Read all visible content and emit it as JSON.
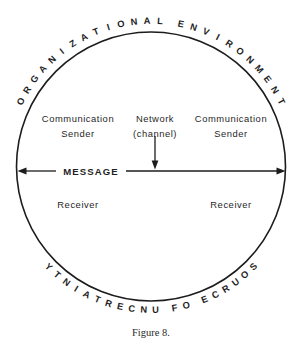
{
  "figure": {
    "caption": "Figure 8.",
    "arc_top": "ORGANIZATIONAL ENVIRONMENT",
    "arc_bottom": "SOURCE OF UNCERTAINTY",
    "left_sender_line1": "Communication",
    "left_sender_line2": "Sender",
    "center_line1": "Network",
    "center_line2": "(channel)",
    "right_sender_line1": "Communication",
    "right_sender_line2": "Sender",
    "message_label": "MESSAGE",
    "left_receiver": "Receiver",
    "right_receiver": "Receiver",
    "colors": {
      "ink": "#1c1c1c",
      "background": "#ffffff"
    }
  },
  "chart_data": {
    "type": "diagram",
    "title": "Figure 8.",
    "shape": "circle",
    "circle": {
      "cx": 151,
      "cy": 166,
      "r": 134
    },
    "arc_labels": [
      {
        "name": "arc-top",
        "text": "ORGANIZATIONAL ENVIRONMENT",
        "position": "top-outside"
      },
      {
        "name": "arc-bottom",
        "text": "SOURCE OF UNCERTAINTY",
        "position": "bottom-outside"
      }
    ],
    "nodes": [
      {
        "name": "left-sender",
        "text": "Communication Sender",
        "x": 78,
        "y": 122
      },
      {
        "name": "network",
        "text": "Network (channel)",
        "x": 155,
        "y": 122
      },
      {
        "name": "right-sender",
        "text": "Communication Sender",
        "x": 230,
        "y": 122
      },
      {
        "name": "left-receiver",
        "text": "Receiver",
        "x": 78,
        "y": 204
      },
      {
        "name": "right-receiver",
        "text": "Receiver",
        "x": 230,
        "y": 204
      }
    ],
    "arrows": [
      {
        "name": "message-arrow",
        "label": "MESSAGE",
        "orientation": "horizontal",
        "heads": "both",
        "x1": 18,
        "x2": 285,
        "y": 171
      },
      {
        "name": "network-arrow",
        "label": "",
        "orientation": "vertical",
        "heads": "down",
        "x": 155,
        "y1": 137,
        "y2": 167
      }
    ]
  }
}
